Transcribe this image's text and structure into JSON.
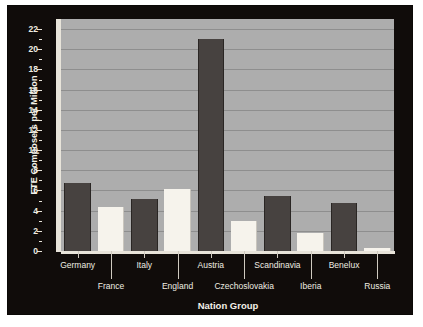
{
  "chart_data": {
    "type": "bar",
    "title": "",
    "xlabel": "Nation Group",
    "ylabel": "FTE Composers per Million",
    "categories": [
      "Germany",
      "France",
      "Italy",
      "England",
      "Austria",
      "Czechoslovakia",
      "Scandinavia",
      "Iberia",
      "Benelux",
      "Russia"
    ],
    "values": [
      6.7,
      4.4,
      5.2,
      6.1,
      21.0,
      3.0,
      5.5,
      1.8,
      4.8,
      0.3
    ],
    "bar_styles": [
      "dark",
      "light",
      "dark",
      "light",
      "dark",
      "light",
      "dark",
      "light",
      "dark",
      "light"
    ],
    "ylim": [
      0,
      23
    ],
    "yticks": [
      0,
      2,
      4,
      6,
      8,
      10,
      12,
      14,
      16,
      18,
      20,
      22
    ],
    "ytick_labels": [
      "0",
      "2",
      "4",
      "6",
      "8",
      "10",
      "12",
      "14",
      "16",
      "18",
      "20",
      "22"
    ],
    "grid": true,
    "legend": "none",
    "colors": {
      "panel_background": "#100c0a",
      "plot_background": "#adadad",
      "gridline": "#8e8e8e",
      "bar_dark": "#474240",
      "bar_light": "#f6f3ec",
      "axis": "#e8e4da",
      "text": "#efece2"
    }
  }
}
